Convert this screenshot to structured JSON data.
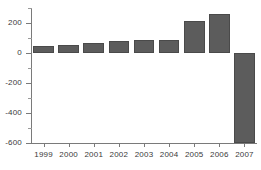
{
  "chart_data": {
    "type": "bar",
    "title": "",
    "xlabel": "",
    "ylabel": "",
    "categories": [
      "1999",
      "2000",
      "2001",
      "2002",
      "2003",
      "2004",
      "2005",
      "2006",
      "2007"
    ],
    "values": [
      50,
      55,
      70,
      80,
      90,
      90,
      215,
      260,
      -600
    ],
    "ylim": [
      -600,
      300
    ],
    "yticks": [
      200,
      0,
      -200,
      -400,
      -600
    ],
    "ytick_labels": [
      "200",
      "0",
      "-200",
      "-400",
      "-600"
    ],
    "yminor_ticks": [
      300,
      100,
      -100,
      -300,
      -500
    ],
    "grid": false,
    "legend": null,
    "bar_color": "#5c5c5c",
    "bar_edge_color": "#4a4a4a",
    "axis_color": "#7a7a7a",
    "background_color": "#ffffff",
    "zero_line_value": 0
  }
}
